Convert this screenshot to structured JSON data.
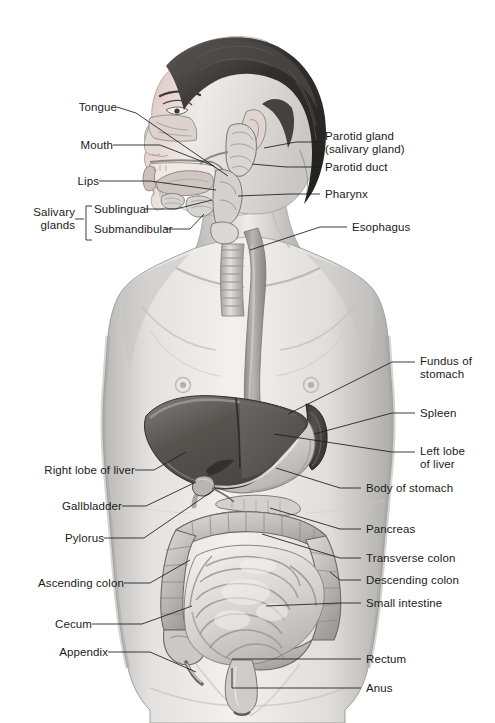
{
  "figure": {
    "width": 495,
    "height": 723,
    "background_color": "#ffffff",
    "line_color": "#1b1b1b",
    "text_color": "#1b1b1b",
    "style": "grayscale medical illustration"
  },
  "palette": {
    "background": "#ffffff",
    "skin_light": "#f0efed",
    "skin_mid": "#d8d6d3",
    "skin_shadow": "#a9a7a4",
    "hair_dark": "#2e2c2b",
    "hair_mid": "#4a4846",
    "liver_dark": "#4e4d4c",
    "liver_mid": "#6e6c6a",
    "stomach": "#cfcdcb",
    "intestine_light": "#e6e4e2",
    "intestine_mid": "#c4c2bf",
    "colon_mid": "#b9b7b4",
    "esophagus": "#9b9996",
    "outline": "#56544f"
  },
  "labels_left": [
    {
      "id": "tongue",
      "text": "Tongue",
      "x": 78,
      "y": 104,
      "leader_to": [
        228,
        176
      ]
    },
    {
      "id": "mouth",
      "text": "Mouth",
      "x": 78,
      "y": 148,
      "leader_to": [
        214,
        166
      ]
    },
    {
      "id": "lips",
      "text": "Lips",
      "x": 78,
      "y": 184,
      "leader_to": [
        216,
        190
      ]
    },
    {
      "id": "sublingual",
      "text": "Sublingual",
      "x": 78,
      "y": 212,
      "leader_to": [
        212,
        200
      ]
    },
    {
      "id": "submandibular",
      "text": "Submandibular",
      "x": 78,
      "y": 232,
      "leader_to": [
        200,
        212
      ]
    },
    {
      "id": "right-lobe-of-liver",
      "text": "Right lobe of liver",
      "x": 128,
      "y": 472,
      "leader_to": [
        182,
        452
      ]
    },
    {
      "id": "gallbladder",
      "text": "Gallbladder",
      "x": 128,
      "y": 508,
      "leader_to": [
        190,
        488
      ]
    },
    {
      "id": "pylorus",
      "text": "Pylorus",
      "x": 128,
      "y": 540,
      "leader_to": [
        216,
        498
      ]
    },
    {
      "id": "ascending-colon",
      "text": "Ascending colon",
      "x": 128,
      "y": 585,
      "leader_to": [
        194,
        562
      ]
    },
    {
      "id": "cecum",
      "text": "Cecum",
      "x": 128,
      "y": 626,
      "leader_to": [
        196,
        608
      ]
    },
    {
      "id": "appendix",
      "text": "Appendix",
      "x": 128,
      "y": 654,
      "leader_to": [
        204,
        628
      ]
    }
  ],
  "labels_left_group": {
    "id": "salivary-glands",
    "line1": "Salivary",
    "line2": "glands",
    "x": 30,
    "y": 212,
    "bracket_members": [
      "Sublingual",
      "Submandibular"
    ]
  },
  "labels_right": [
    {
      "id": "parotid-gland",
      "text": "Parotid gland",
      "x": 325,
      "y": 136,
      "leader_to": [
        262,
        148
      ]
    },
    {
      "id": "parotid-gland-sub",
      "text": "(salivary gland)",
      "x": 325,
      "y": 150,
      "leader_to": null
    },
    {
      "id": "parotid-duct",
      "text": "Parotid duct",
      "x": 325,
      "y": 169,
      "leader_to": [
        248,
        168
      ]
    },
    {
      "id": "pharynx",
      "text": "Pharynx",
      "x": 325,
      "y": 196,
      "leader_to": [
        236,
        196
      ]
    },
    {
      "id": "esophagus",
      "text": "Esophagus",
      "x": 352,
      "y": 229,
      "leader_to": [
        250,
        248
      ]
    },
    {
      "id": "fundus-of-stomach",
      "text": "Fundus of",
      "x": 420,
      "y": 360,
      "leader_to": [
        288,
        414
      ]
    },
    {
      "id": "fundus-of-stomach-2",
      "text": "stomach",
      "x": 420,
      "y": 373,
      "leader_to": null
    },
    {
      "id": "spleen",
      "text": "Spleen",
      "x": 420,
      "y": 415,
      "leader_to": [
        312,
        432
      ]
    },
    {
      "id": "left-lobe-of-liver",
      "text": "Left lobe",
      "x": 420,
      "y": 450,
      "leader_to": [
        272,
        432
      ]
    },
    {
      "id": "left-lobe-of-liver-2",
      "text": "of liver",
      "x": 420,
      "y": 463,
      "leader_to": null
    },
    {
      "id": "body-of-stomach",
      "text": "Body of stomach",
      "x": 366,
      "y": 490,
      "leader_to": [
        272,
        466
      ]
    },
    {
      "id": "pancreas",
      "text": "Pancreas",
      "x": 366,
      "y": 531,
      "leader_to": [
        266,
        506
      ]
    },
    {
      "id": "transverse-colon",
      "text": "Transverse colon",
      "x": 366,
      "y": 560,
      "leader_to": [
        258,
        532
      ]
    },
    {
      "id": "descending-colon",
      "text": "Descending colon",
      "x": 366,
      "y": 582,
      "leader_to": [
        322,
        570
      ]
    },
    {
      "id": "small-intestine",
      "text": "Small intestine",
      "x": 366,
      "y": 605,
      "leader_to": [
        262,
        606
      ]
    },
    {
      "id": "rectum",
      "text": "Rectum",
      "x": 366,
      "y": 661,
      "leader_to": [
        234,
        661
      ]
    },
    {
      "id": "anus",
      "text": "Anus",
      "x": 366,
      "y": 690,
      "leader_to": [
        234,
        690
      ]
    }
  ],
  "organ_regions": [
    "tongue",
    "mouth",
    "lips",
    "sublingual gland",
    "submandibular gland",
    "parotid gland",
    "parotid duct",
    "pharynx",
    "esophagus",
    "trachea",
    "fundus of stomach",
    "body of stomach",
    "spleen",
    "right lobe of liver",
    "left lobe of liver",
    "gallbladder",
    "pylorus",
    "pancreas",
    "transverse colon",
    "ascending colon",
    "descending colon",
    "small intestine",
    "cecum",
    "appendix",
    "rectum",
    "anus"
  ]
}
